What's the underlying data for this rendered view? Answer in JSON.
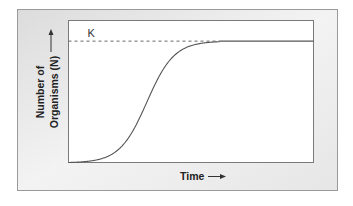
{
  "chart_data": {
    "type": "line",
    "title": "",
    "xlabel": "Time",
    "ylabel_lines": [
      "Number of",
      "Organisms (N)"
    ],
    "ylabel": "Number of Organisms (N)",
    "x_arrow": "→",
    "y_arrow": "→",
    "xlim": [
      0,
      10
    ],
    "ylim": [
      0,
      1.17
    ],
    "grid": false,
    "legend": "none",
    "carrying_capacity": {
      "label": "K",
      "value": 1.0,
      "style": "dashed until curve meets it"
    },
    "series": [
      {
        "name": "logistic growth",
        "model": "logistic",
        "K": 1.0,
        "r": 1.8,
        "t0": 3.2,
        "x": [
          0,
          0.5,
          1,
          1.5,
          2,
          2.5,
          3,
          3.5,
          4,
          4.5,
          5,
          5.5,
          6,
          7,
          8,
          9,
          10
        ],
        "y": [
          0.003,
          0.008,
          0.019,
          0.045,
          0.103,
          0.221,
          0.411,
          0.632,
          0.809,
          0.912,
          0.962,
          0.984,
          0.994,
          1.0,
          1.0,
          1.0,
          1.0
        ]
      }
    ]
  },
  "colors": {
    "frame_dark": "#d8d8d8",
    "frame_light": "#f4f4f4",
    "frame_border": "#8a8a8a",
    "plot_bg": "#ffffff",
    "axis": "#555555",
    "curve": "#555555",
    "text": "#222222"
  }
}
